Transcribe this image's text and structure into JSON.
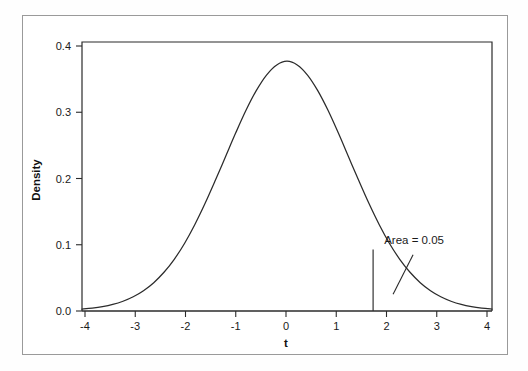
{
  "figure": {
    "name": "t-distribution-density-plot",
    "background_color": "#ffffff",
    "frame_color": "#9a9a9a",
    "axis_color": "#1a1a1a",
    "curve_color": "#2b2b2b"
  },
  "chart_data": {
    "type": "line",
    "title": "",
    "subtitle": "",
    "xlabel": "t",
    "ylabel": "Density",
    "xlim": [
      -4,
      4
    ],
    "ylim": [
      0.0,
      0.42
    ],
    "grid": false,
    "legend": null,
    "x_ticks": [
      -4,
      -3,
      -2,
      -1,
      0,
      1,
      2,
      3,
      4
    ],
    "x_tick_labels": [
      "-4",
      "-3",
      "-2",
      "-1",
      "0",
      "1",
      "2",
      "3",
      "4"
    ],
    "y_ticks": [
      0.0,
      0.1,
      0.2,
      0.3,
      0.4
    ],
    "y_tick_labels": [
      "0.0",
      "0.1",
      "0.2",
      "0.3",
      "0.4"
    ],
    "series": [
      {
        "name": "t density",
        "x": [
          -4.0,
          -3.8,
          -3.6,
          -3.4,
          -3.2,
          -3.0,
          -2.8,
          -2.6,
          -2.4,
          -2.2,
          -2.0,
          -1.8,
          -1.6,
          -1.4,
          -1.2,
          -1.0,
          -0.8,
          -0.6,
          -0.4,
          -0.2,
          0.0,
          0.2,
          0.4,
          0.6,
          0.8,
          1.0,
          1.2,
          1.4,
          1.6,
          1.8,
          2.0,
          2.2,
          2.4,
          2.6,
          2.8,
          3.0,
          3.2,
          3.4,
          3.6,
          3.8,
          4.0
        ],
        "y": [
          0.0015,
          0.0023,
          0.0035,
          0.0053,
          0.0079,
          0.0115,
          0.0164,
          0.0229,
          0.0313,
          0.0418,
          0.0546,
          0.0697,
          0.0868,
          0.1054,
          0.1247,
          0.144,
          0.1622,
          0.1781,
          0.1907,
          0.1989,
          0.2019,
          0.1989,
          0.1907,
          0.1781,
          0.1622,
          0.144,
          0.1247,
          0.1054,
          0.0868,
          0.0697,
          0.0546,
          0.0418,
          0.0313,
          0.0229,
          0.0164,
          0.0115,
          0.0079,
          0.0053,
          0.0035,
          0.0023,
          0.0015
        ]
      }
    ],
    "peak": {
      "x": 0.0,
      "y": 0.39
    },
    "critical_line": {
      "x": 1.68,
      "y_top": 0.096,
      "label": "critical value"
    },
    "annotations": [
      {
        "text": "Area = 0.05",
        "x": 2.48,
        "y": 0.105,
        "leader_from": {
          "x": 2.46,
          "y": 0.088
        },
        "leader_to": {
          "x": 2.07,
          "y": 0.026
        }
      }
    ]
  }
}
